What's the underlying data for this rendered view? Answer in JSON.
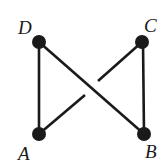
{
  "diagram": {
    "title": "",
    "nodes": [
      {
        "id": "D",
        "label": "D",
        "x": 39,
        "y": 42,
        "label_x": 18,
        "label_y": 34
      },
      {
        "id": "C",
        "label": "C",
        "x": 142,
        "y": 42,
        "label_x": 144,
        "label_y": 32
      },
      {
        "id": "A",
        "label": "A",
        "x": 39,
        "y": 134,
        "label_x": 18,
        "label_y": 160
      },
      {
        "id": "B",
        "label": "B",
        "x": 144,
        "y": 134,
        "label_x": 145,
        "label_y": 158
      }
    ],
    "edges": [
      {
        "from": "D",
        "to": "A",
        "type": "solid"
      },
      {
        "from": "C",
        "to": "B",
        "type": "solid"
      },
      {
        "from": "D",
        "to": "B",
        "type": "solid-over"
      },
      {
        "from": "A",
        "to": "C",
        "type": "broken-under"
      }
    ],
    "colors": {
      "ink": "#1a1a1a",
      "background": "#ffffff"
    }
  }
}
